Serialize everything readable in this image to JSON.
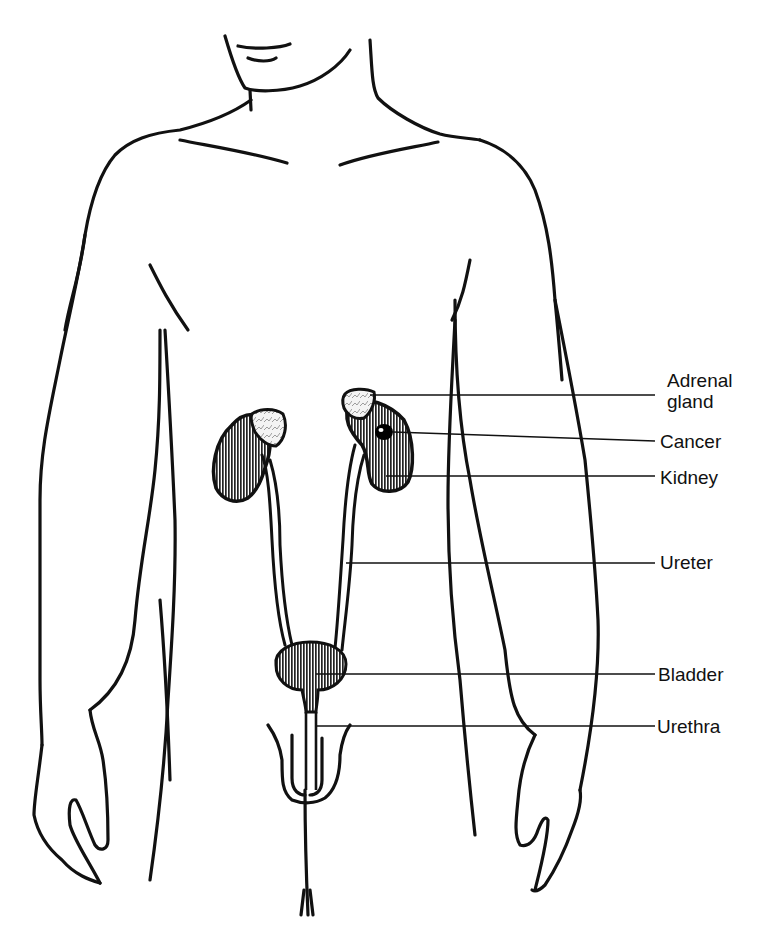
{
  "diagram": {
    "title": "",
    "colors": {
      "line": "#111111",
      "fill": "#ffffff",
      "organ_hatch": "#222222",
      "tumor": "#000000"
    },
    "labels": [
      {
        "id": "adrenal-gland",
        "text": "Adrenal\ngland",
        "x": 667,
        "y": 372
      },
      {
        "id": "cancer",
        "text": "Cancer",
        "x": 660,
        "y": 432
      },
      {
        "id": "kidney",
        "text": "Kidney",
        "x": 660,
        "y": 469
      },
      {
        "id": "ureter",
        "text": "Ureter",
        "x": 660,
        "y": 553
      },
      {
        "id": "bladder",
        "text": "Bladder",
        "x": 658,
        "y": 674
      },
      {
        "id": "urethra",
        "text": "Urethra",
        "x": 657,
        "y": 721
      }
    ]
  }
}
